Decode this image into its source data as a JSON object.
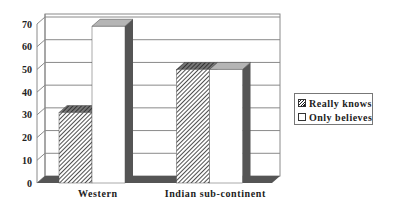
{
  "chart_data": {
    "type": "bar",
    "style": "3d-clustered-column",
    "title": "",
    "xlabel": "",
    "ylabel": "",
    "categories": [
      "Western",
      "Indian sub-continent"
    ],
    "series": [
      {
        "name": "Really knows",
        "values": [
          31,
          50
        ],
        "fill": "hatched"
      },
      {
        "name": "Only believes",
        "values": [
          69,
          50
        ],
        "fill": "white"
      }
    ],
    "ylim": [
      0,
      70
    ],
    "yticks": [
      0,
      10,
      20,
      30,
      40,
      50,
      60,
      70
    ],
    "grid": true,
    "legend_position": "right"
  },
  "colors": {
    "side_face": "#555555",
    "top_white": "#b5b5b5",
    "top_hatch": "#555555",
    "floor": "#555555",
    "grid": "#8a8a8a",
    "text": "#222222"
  },
  "legend": {
    "items": [
      {
        "label": "Really knows"
      },
      {
        "label": "Only believes"
      }
    ]
  }
}
